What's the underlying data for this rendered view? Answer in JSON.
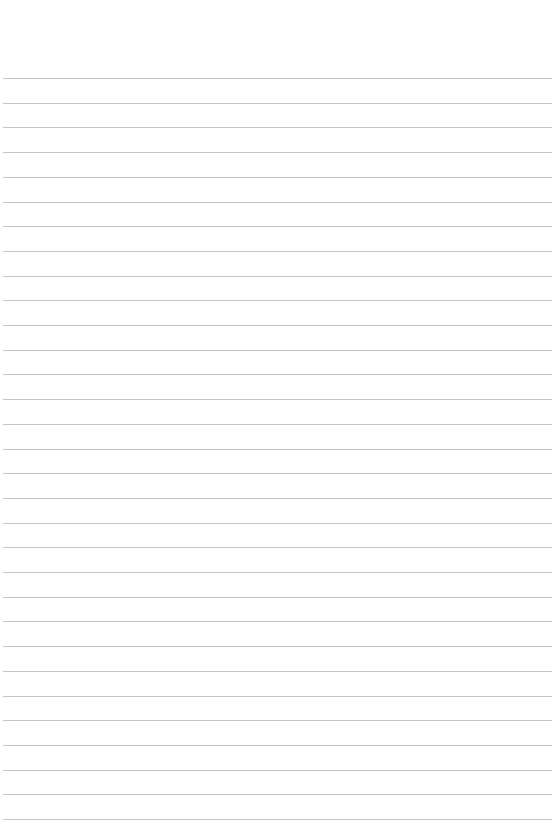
{
  "document": {
    "type": "lined-paper",
    "background_color": "#ffffff",
    "line_color": "#c4c4c4",
    "line_count": 31,
    "first_line_y": 78,
    "line_spacing": 24.7,
    "line_left": 3,
    "line_right": 552,
    "text": ""
  }
}
